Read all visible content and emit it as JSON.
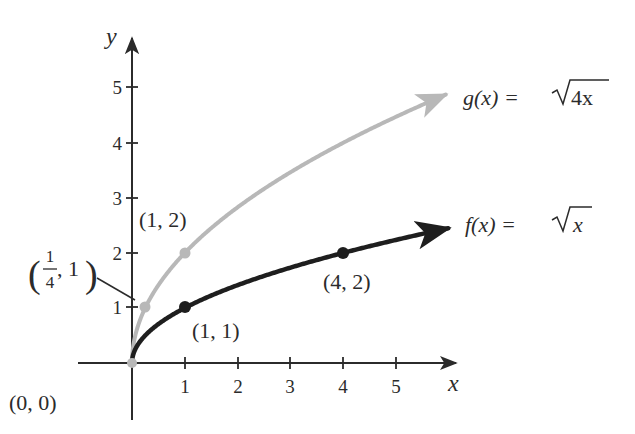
{
  "chart_data": {
    "type": "line",
    "title": "",
    "xlabel": "x",
    "ylabel": "y",
    "xlim": [
      -0.7,
      6
    ],
    "ylim": [
      -0.7,
      5.9
    ],
    "grid": false,
    "x_ticks": [
      "1",
      "2",
      "3",
      "4",
      "5"
    ],
    "y_ticks": [
      "1",
      "2",
      "3",
      "4",
      "5"
    ],
    "series": [
      {
        "name": "g(x) = √4x",
        "label_parts": {
          "fn": "g(x) = ",
          "radicand": "4x"
        },
        "function": "sqrt(4x)",
        "color": "#b8b8b8",
        "x_range": [
          0,
          5.95
        ],
        "key_points": [
          {
            "x": 0,
            "y": 0,
            "label": "(0, 0)"
          },
          {
            "x": 0.25,
            "y": 1,
            "label": "(1/4, 1)"
          },
          {
            "x": 1,
            "y": 2,
            "label": "(1, 2)"
          }
        ]
      },
      {
        "name": "f(x) = √x",
        "label_parts": {
          "fn": "f(x) = ",
          "radicand": "x"
        },
        "function": "sqrt(x)",
        "color": "#1e1e1e",
        "x_range": [
          0,
          6
        ],
        "key_points": [
          {
            "x": 0,
            "y": 0,
            "label": "(0, 0)"
          },
          {
            "x": 1,
            "y": 1,
            "label": "(1, 1)"
          },
          {
            "x": 4,
            "y": 2,
            "label": "(4, 2)"
          }
        ]
      }
    ],
    "annotations": [
      {
        "text": "(0, 0)",
        "at": [
          0,
          0
        ]
      },
      {
        "text": "(1/4, 1)",
        "at": [
          0.25,
          1
        ],
        "leader_line": true
      },
      {
        "text": "(1, 2)",
        "at": [
          1,
          2
        ]
      },
      {
        "text": "(1, 1)",
        "at": [
          1,
          1
        ]
      },
      {
        "text": "(4, 2)",
        "at": [
          4,
          2
        ]
      }
    ]
  },
  "labels": {
    "x_axis": "x",
    "y_axis": "y",
    "g_fn": "g(x) = ",
    "g_radicand": "4x",
    "f_fn": "f(x) = ",
    "f_radicand": "x",
    "origin": "(0, 0)",
    "pt_1_2": "(1, 2)",
    "pt_1_1": "(1, 1)",
    "pt_4_2": "(4, 2)",
    "quarter_num": "1",
    "quarter_den": "4",
    "quarter_rest": ", 1",
    "tick_x": [
      "1",
      "2",
      "3",
      "4",
      "5"
    ],
    "tick_y": [
      "1",
      "2",
      "3",
      "4",
      "5"
    ]
  }
}
